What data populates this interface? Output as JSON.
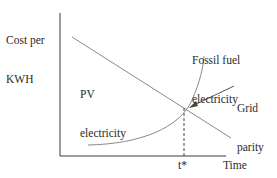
{
  "diagram": {
    "y_axis_label_line1": "Cost per",
    "y_axis_label_line2": "KWH",
    "x_axis_label": "Time",
    "pv_label_line1": "PV",
    "pv_label_line2": "electricity",
    "fossil_label_line1": "Fossil fuel",
    "fossil_label_line2": "electricity",
    "grid_label_line1": "Grid",
    "grid_label_line2": "parity",
    "t_star_label": "t*",
    "colors": {
      "axis": "#3a3a3a",
      "curve": "#8a8a8a",
      "text": "#2a2a2a"
    }
  }
}
